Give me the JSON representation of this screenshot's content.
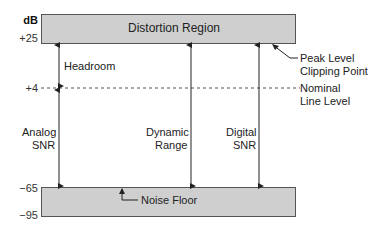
{
  "axis": {
    "unit": "dB",
    "ticks": [
      {
        "label": "+25",
        "value": 25
      },
      {
        "label": "+4",
        "value": 4
      },
      {
        "label": "−65",
        "value": -65
      },
      {
        "label": "−95",
        "value": -95
      }
    ]
  },
  "regions": {
    "top": {
      "label": "Distortion Region",
      "fill": "#cfcfcf"
    },
    "bottom": {
      "label": "Noise Floor",
      "fill": "#cfcfcf"
    }
  },
  "reference_line": {
    "label_line1": "Nominal",
    "label_line2": "Line Level",
    "level": "+4"
  },
  "callouts": {
    "peak_line1": "Peak Level",
    "peak_line2": "Clipping Point",
    "noise_floor": "Noise Floor"
  },
  "spans": [
    {
      "label_line1": "Headroom",
      "label_line2": "",
      "from": "+4",
      "to": "+25"
    },
    {
      "label_line1": "Analog",
      "label_line2": "SNR",
      "from": "-65",
      "to": "+4"
    },
    {
      "label_line1": "Dynamic",
      "label_line2": "Range",
      "from": "-65",
      "to": "+25"
    },
    {
      "label_line1": "Digital",
      "label_line2": "SNR",
      "from": "-65",
      "to": "+25"
    }
  ]
}
